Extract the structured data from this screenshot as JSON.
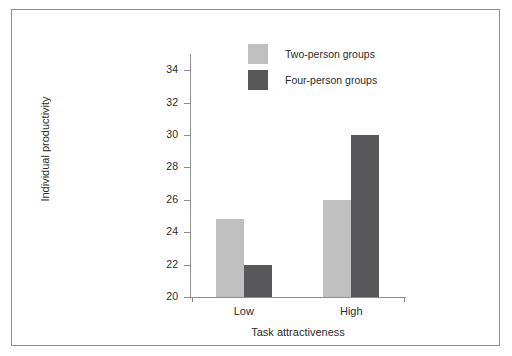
{
  "chart_data": {
    "type": "bar",
    "title": "",
    "xlabel": "Task attractiveness",
    "ylabel": "Individual productivity",
    "categories": [
      "Low",
      "High"
    ],
    "series": [
      {
        "name": "Two-person groups",
        "values": [
          24.8,
          26.0
        ],
        "color": "#c0c0c0"
      },
      {
        "name": "Four-person groups",
        "values": [
          22.0,
          30.0
        ],
        "color": "#58585a"
      }
    ],
    "ylim": [
      20,
      35
    ],
    "yticks": [
      20,
      22,
      24,
      26,
      28,
      30,
      32,
      34
    ],
    "ytick_labels": [
      "20",
      "22",
      "24",
      "26",
      "28",
      "30",
      "32",
      "34"
    ],
    "grid": false,
    "legend_position": "top-center"
  },
  "legend": {
    "entries": [
      {
        "label": "Two-person groups",
        "color": "#c0c0c0"
      },
      {
        "label": "Four-person groups",
        "color": "#58585a"
      }
    ]
  },
  "axes": {
    "x_title": "Task attractiveness",
    "y_title": "Individual productivity",
    "x_tick_labels": [
      "Low",
      "High"
    ],
    "y_tick_labels": [
      "20",
      "22",
      "24",
      "26",
      "28",
      "30",
      "32",
      "34"
    ]
  },
  "style": {
    "frame_color": "#8d8d8d",
    "axis_color": "#8d8d8d",
    "text_color": "#2b2b2b",
    "background": "#ffffff"
  }
}
